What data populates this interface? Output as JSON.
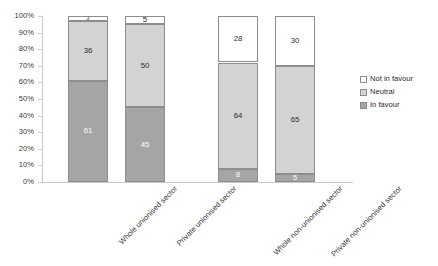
{
  "chart_data": {
    "type": "bar",
    "stacked": true,
    "stack_mode": "percent",
    "title": "",
    "subtitle": "",
    "xlabel": "",
    "ylabel": "",
    "ylim": [
      0,
      100
    ],
    "ytick_labels": [
      "100%",
      "90%",
      "80%",
      "70%",
      "60%",
      "50%",
      "40%",
      "30%",
      "20%",
      "10%",
      "0%"
    ],
    "ytick_values": [
      100,
      90,
      80,
      70,
      60,
      50,
      40,
      30,
      20,
      10,
      0
    ],
    "grid": false,
    "legend_position": "right",
    "categories": [
      "Whole unionised sector",
      "Private unionised sector",
      "Whole non-unionised sector",
      "Private non-unionised sector"
    ],
    "series": [
      {
        "name": "Not in favour",
        "color": "#ffffff",
        "values": [
          3,
          5,
          28,
          30
        ]
      },
      {
        "name": "Neutral",
        "color": "#d3d3d3",
        "values": [
          36,
          50,
          64,
          65
        ]
      },
      {
        "name": "In favour",
        "color": "#a5a5a5",
        "values": [
          61,
          45,
          8,
          5
        ]
      }
    ],
    "data_labels": [
      {
        "category": "Whole unionised sector",
        "In favour": 61,
        "Neutral": 36,
        "Not in favour": 3
      },
      {
        "category": "Private unionised sector",
        "In favour": 45,
        "Neutral": 50,
        "Not in favour": 5
      },
      {
        "category": "Whole non-unionised sector",
        "In favour": 8,
        "Neutral": 64,
        "Not in favour": 28
      },
      {
        "category": "Private non-unionised sector",
        "In favour": 5,
        "Neutral": 65,
        "Not in favour": 30
      }
    ]
  },
  "legend": {
    "items": [
      {
        "label": "Not in favour",
        "swatch": "s-notinfavour"
      },
      {
        "label": "Neutral",
        "swatch": "s-neutral"
      },
      {
        "label": "In favour",
        "swatch": "s-infavour"
      }
    ]
  },
  "colors": {
    "not_in_favour": "#ffffff",
    "neutral": "#d3d3d3",
    "in_favour": "#a5a5a5",
    "axis": "#c9c9c9",
    "text": "#2b2b2b"
  }
}
